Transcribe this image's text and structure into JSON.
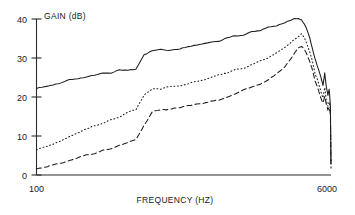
{
  "chart_data": {
    "type": "line",
    "title": "",
    "xlabel": "FREQUENCY (HZ)",
    "ylabel": "GAIN (dB)",
    "xscale": "log",
    "xlim": [
      100,
      6000
    ],
    "ylim": [
      0,
      40
    ],
    "yticks": [
      0,
      10,
      20,
      30,
      40
    ],
    "ytick_labels": [
      "0",
      "10",
      "20",
      "30",
      "40"
    ],
    "xticks": [
      100,
      6000
    ],
    "xtick_labels": [
      "100",
      "6000"
    ],
    "grid": false,
    "legend": "none",
    "x": [
      100,
      112,
      126,
      141,
      158,
      178,
      200,
      224,
      251,
      282,
      316,
      355,
      398,
      447,
      501,
      562,
      631,
      708,
      794,
      891,
      1000,
      1122,
      1259,
      1413,
      1585,
      1778,
      1995,
      2239,
      2512,
      2818,
      3162,
      3548,
      3802,
      3981,
      4150,
      4300,
      4467,
      4650,
      4800,
      5012,
      5200,
      5370,
      5500,
      5623,
      5750,
      5850,
      5950,
      6000
    ],
    "series": [
      {
        "name": "solid",
        "style": "solid",
        "values": [
          22.2,
          22.6,
          23.2,
          23.6,
          24.2,
          24.6,
          25.1,
          25.4,
          25.9,
          26.3,
          26.7,
          27.0,
          27.3,
          30.6,
          32.1,
          32.3,
          32.2,
          32.4,
          32.6,
          33.0,
          33.4,
          33.9,
          34.5,
          35.1,
          35.7,
          36.0,
          36.6,
          37.2,
          37.8,
          38.4,
          39.3,
          39.9,
          40.0,
          39.6,
          38.5,
          37.0,
          35.0,
          32.4,
          30.0,
          27.6,
          25.2,
          23.0,
          26.3,
          22.4,
          20.5,
          21.8,
          17.8,
          3.0
        ]
      },
      {
        "name": "dotted",
        "style": "dotted",
        "values": [
          6.4,
          7.2,
          8.0,
          8.9,
          9.8,
          10.7,
          11.6,
          12.4,
          13.3,
          14.1,
          15.0,
          15.9,
          16.8,
          20.6,
          22.0,
          22.2,
          22.5,
          22.9,
          23.3,
          23.8,
          24.3,
          24.9,
          25.5,
          26.1,
          26.8,
          27.5,
          28.3,
          29.2,
          30.2,
          31.3,
          32.6,
          34.5,
          35.7,
          36.0,
          35.2,
          33.6,
          31.4,
          28.8,
          26.2,
          23.8,
          21.6,
          20.0,
          22.6,
          19.2,
          17.5,
          18.6,
          16.8,
          2.6
        ]
      },
      {
        "name": "dashed",
        "style": "dashed",
        "values": [
          1.6,
          1.8,
          2.6,
          3.0,
          3.9,
          4.4,
          5.2,
          5.7,
          6.5,
          7.0,
          7.8,
          8.4,
          9.2,
          12.8,
          16.0,
          16.7,
          16.8,
          17.0,
          17.4,
          17.8,
          18.2,
          18.8,
          19.4,
          20.1,
          20.8,
          21.6,
          22.5,
          23.5,
          24.6,
          25.9,
          27.6,
          30.6,
          32.4,
          33.0,
          32.4,
          31.0,
          29.0,
          26.6,
          24.2,
          22.0,
          20.0,
          18.6,
          20.4,
          17.8,
          16.4,
          17.6,
          15.6,
          1.8
        ]
      }
    ]
  },
  "axes": {
    "y_axis_title": "GAIN (dB)",
    "x_axis_title": "FREQUENCY (HZ)",
    "y_tick_0": "0",
    "y_tick_10": "10",
    "y_tick_20": "20",
    "y_tick_30": "30",
    "y_tick_40": "40",
    "x_tick_min": "100",
    "x_tick_max": "6000"
  }
}
